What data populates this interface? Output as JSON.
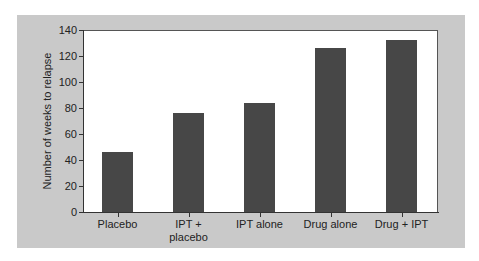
{
  "chart_data": {
    "type": "bar",
    "title": "",
    "xlabel": "",
    "ylabel": "Number of weeks to relapse",
    "categories": [
      "Placebo",
      "IPT + placebo",
      "IPT alone",
      "Drug alone",
      "Drug + IPT"
    ],
    "category_lines": [
      [
        "Placebo"
      ],
      [
        "IPT +",
        "placebo"
      ],
      [
        "IPT alone"
      ],
      [
        "Drug alone"
      ],
      [
        "Drug + IPT"
      ]
    ],
    "values": [
      46,
      76,
      84,
      126,
      132
    ],
    "ylim": [
      0,
      140
    ],
    "yticks": [
      0,
      20,
      40,
      60,
      80,
      100,
      120,
      140
    ],
    "grid": false,
    "legend": null,
    "colors": {
      "bar": "#474747",
      "panel": "#c9c9c9",
      "plot_bg": "#ffffff"
    }
  }
}
